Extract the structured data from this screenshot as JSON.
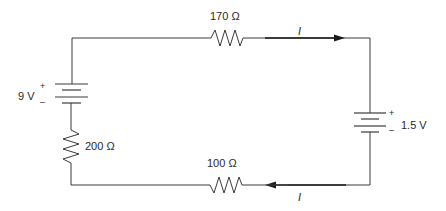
{
  "diagram": {
    "type": "series circuit",
    "components": {
      "battery_left": {
        "label": "9 V",
        "positive": "+",
        "negative": "–"
      },
      "battery_right": {
        "label": "1.5 V",
        "positive": "+",
        "negative": "–"
      },
      "resistor_top": {
        "label": "170 Ω"
      },
      "resistor_bottom": {
        "label": "100 Ω"
      },
      "resistor_left": {
        "label": "200 Ω"
      }
    },
    "currents": {
      "top": {
        "label": "I",
        "direction": "right"
      },
      "bottom": {
        "label": "I",
        "direction": "left"
      }
    },
    "colors": {
      "wire": "#3a3a3a",
      "text": "#2a2a2a"
    }
  }
}
